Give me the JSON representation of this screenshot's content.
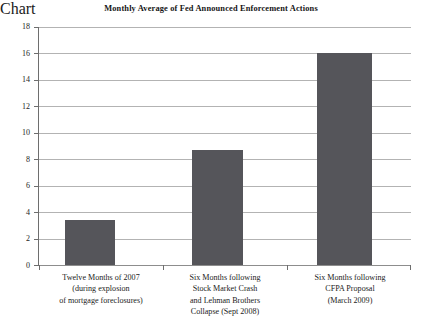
{
  "chart_data": {
    "type": "bar",
    "title": "Monthly Average of Fed Announced Enforcement Actions",
    "xlabel": "",
    "ylabel": "",
    "ylim": [
      0,
      18
    ],
    "ytick_step": 2,
    "grid": true,
    "legend": false,
    "bar_color": "#55555a",
    "gridline_color": "#b3b3b3",
    "axis_color": "#6e6e6e",
    "background_color": "#ffffff",
    "categories": [
      "Twelve Months of 2007 (during explosion of mortgage foreclosures)",
      "Six Months following Stock Market Crash and Lehman Brothers Collapse (Sept 2008)",
      "Six Months following CFPA Proposal (March 2009)"
    ],
    "values": [
      3.4,
      8.7,
      16
    ],
    "ytick_labels": [
      "0",
      "2",
      "4",
      "6",
      "8",
      "10",
      "12",
      "14",
      "16",
      "18"
    ],
    "category_label_lines": [
      [
        "Twelve Months of 2007",
        "(during explosion",
        "of mortgage foreclosures)"
      ],
      [
        "Six Months following",
        "Stock Market Crash",
        "and Lehman Brothers",
        "Collapse (Sept 2008)"
      ],
      [
        "Six Months following",
        "CFPA Proposal",
        "(March 2009)"
      ]
    ]
  }
}
